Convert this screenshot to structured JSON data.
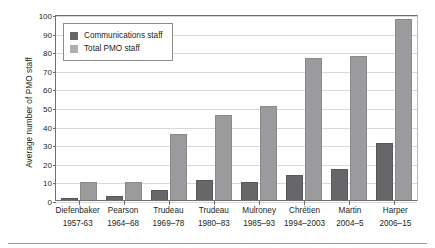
{
  "chart_data": {
    "type": "bar",
    "title": "",
    "xlabel": "",
    "ylabel": "Average number of PMO staff",
    "ylim": [
      0,
      100
    ],
    "yticks": [
      0,
      10,
      20,
      30,
      40,
      50,
      60,
      70,
      80,
      90,
      100
    ],
    "grid": true,
    "legend_position": "top-left",
    "categories": [
      "Diefenbaker 1957-63",
      "Pearson 1964–68",
      "Trudeau 1969–78",
      "Trudeau 1980–83",
      "Mulroney 1985–93",
      "Chrétien 1994–2003",
      "Martin 2004–5",
      "Harper 2006–15"
    ],
    "category_parts": [
      {
        "name": "Diefenbaker",
        "years": "1957-63"
      },
      {
        "name": "Pearson",
        "years": "1964–68"
      },
      {
        "name": "Trudeau",
        "years": "1969–78"
      },
      {
        "name": "Trudeau",
        "years": "1980–83"
      },
      {
        "name": "Mulroney",
        "years": "1985–93"
      },
      {
        "name": "Chrétien",
        "years": "1994–2003"
      },
      {
        "name": "Martin",
        "years": "2004–5"
      },
      {
        "name": "Harper",
        "years": "2006–15"
      }
    ],
    "series": [
      {
        "name": "Communications staff",
        "color": "#67676a",
        "values": [
          0.5,
          1.5,
          5,
          10,
          9,
          13,
          16,
          30
        ]
      },
      {
        "name": "Total PMO staff",
        "color": "#9b9b9e",
        "values": [
          9,
          9,
          35,
          45,
          50,
          76,
          77,
          97
        ]
      }
    ]
  },
  "legend": {
    "items": [
      {
        "label": "Communications staff",
        "swatch": "dark"
      },
      {
        "label": "Total PMO staff",
        "swatch": "light"
      }
    ]
  }
}
